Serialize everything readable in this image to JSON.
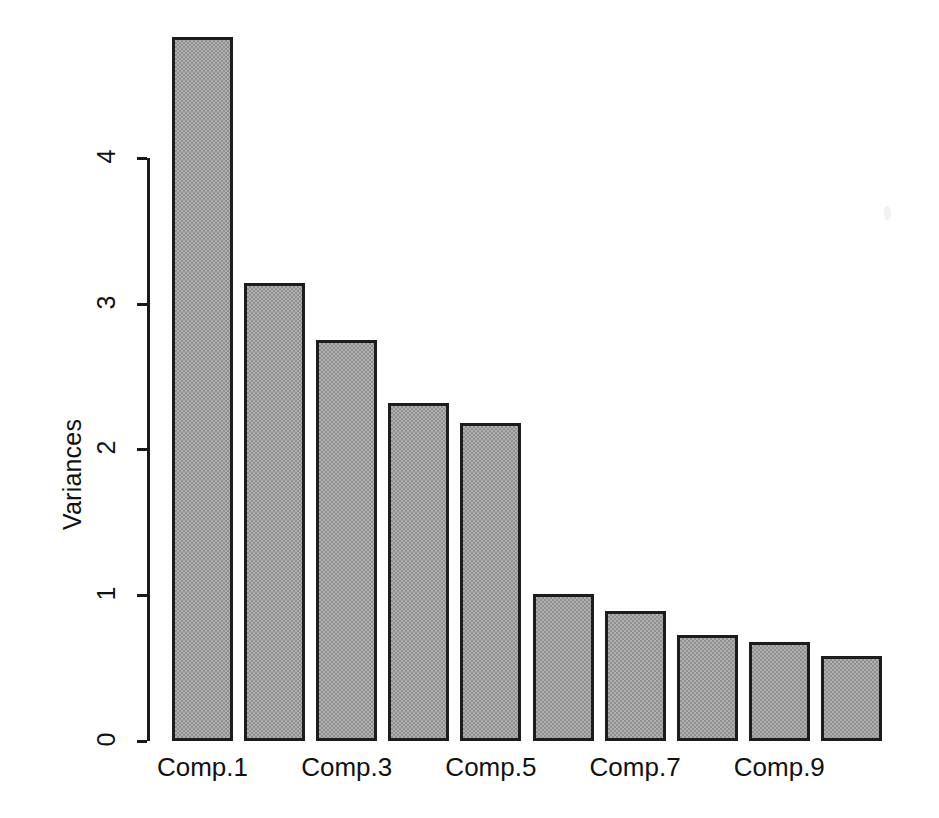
{
  "chart_data": {
    "type": "bar",
    "title": "",
    "xlabel": "",
    "ylabel": "Variances",
    "categories": [
      "Comp.1",
      "Comp.2",
      "Comp.3",
      "Comp.4",
      "Comp.5",
      "Comp.6",
      "Comp.7",
      "Comp.8",
      "Comp.9",
      "Comp.10"
    ],
    "values": [
      4.83,
      3.14,
      2.75,
      2.32,
      2.18,
      1.01,
      0.89,
      0.73,
      0.68,
      0.58
    ],
    "ylim": [
      0,
      5.0
    ],
    "y_ticks": [
      "0",
      "1",
      "2",
      "3",
      "4"
    ],
    "y_tick_values": [
      0,
      1,
      2,
      3,
      4
    ],
    "x_tick_labels": [
      "Comp.1",
      "Comp.3",
      "Comp.5",
      "Comp.7",
      "Comp.9"
    ],
    "x_tick_label_indices": [
      0,
      2,
      4,
      6,
      8
    ],
    "grid": false,
    "legend": null,
    "bar_fill_color": "#b0b0b0",
    "bar_border_color": "#1c1c1c",
    "background_color": "#ffffff"
  },
  "axes": {
    "y_axis_title": "Variances"
  }
}
